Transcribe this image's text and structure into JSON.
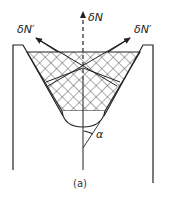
{
  "figure": {
    "caption": "(a)",
    "labels": {
      "normal_force": "δN",
      "left_force": "δN′",
      "right_force": "δN′",
      "angle": "α"
    },
    "colors": {
      "stroke": "#222222",
      "hatch": "#333333",
      "background": "#ffffff"
    }
  }
}
